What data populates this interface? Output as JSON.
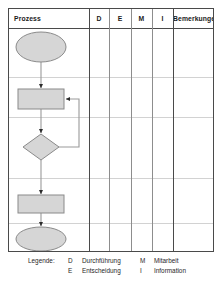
{
  "table": {
    "columns": [
      {
        "key": "prozess",
        "label": "Prozess",
        "x": 0,
        "w": 80,
        "align": "left"
      },
      {
        "key": "d",
        "label": "D",
        "x": 80,
        "w": 20,
        "align": "center"
      },
      {
        "key": "e",
        "label": "E",
        "x": 100,
        "w": 22,
        "align": "center"
      },
      {
        "key": "m",
        "label": "M",
        "x": 122,
        "w": 21,
        "align": "center"
      },
      {
        "key": "i",
        "label": "I",
        "x": 143,
        "w": 21,
        "align": "center"
      },
      {
        "key": "bemerkungen",
        "label": "Bemerkungen",
        "x": 164,
        "w": 40,
        "align": "center"
      }
    ],
    "row_separators_y": [
      68,
      108,
      169,
      214
    ],
    "column_separators_x": [
      80,
      100,
      122,
      143,
      164
    ],
    "border_color": "#4a4a4a",
    "grid_color": "#d2d2d2",
    "column_line_color": "#8d8d8d"
  },
  "flowchart": {
    "shape_fill": "#d6d6d6",
    "shape_stroke": "#8a8a8a",
    "connector_color": "#9a9a9a",
    "arrow_color": "#2b2b2b",
    "nodes": [
      {
        "name": "start-terminator",
        "type": "terminator",
        "cx": 32,
        "cy": 38,
        "rx": 25,
        "ry": 15,
        "label": ""
      },
      {
        "name": "process-step-1",
        "type": "process",
        "x": 9,
        "y": 80,
        "w": 46,
        "h": 20,
        "label": ""
      },
      {
        "name": "decision-step",
        "type": "decision",
        "cx": 32,
        "cy": 138,
        "rx": 18,
        "ry": 13,
        "label": ""
      },
      {
        "name": "process-step-2",
        "type": "process",
        "x": 9,
        "y": 186,
        "w": 46,
        "h": 18,
        "label": ""
      },
      {
        "name": "end-terminator",
        "type": "terminator",
        "cx": 32,
        "cy": 230,
        "rx": 25,
        "ry": 12,
        "label": ""
      }
    ],
    "connectors": [
      {
        "name": "start-to-process1",
        "from": "start-terminator",
        "to": "process-step-1"
      },
      {
        "name": "process1-to-decision",
        "from": "process-step-1",
        "to": "decision-step"
      },
      {
        "name": "decision-to-process2",
        "from": "decision-step",
        "to": "process-step-2"
      },
      {
        "name": "process2-to-end",
        "from": "process-step-2",
        "to": "end-terminator"
      },
      {
        "name": "decision-feedback-loop",
        "from": "decision-step",
        "to": "process-step-1"
      }
    ]
  },
  "legend": {
    "title": "Legende:",
    "entries": [
      {
        "key": "D",
        "text": "Durchführung"
      },
      {
        "key": "E",
        "text": "Entscheidung"
      },
      {
        "key": "M",
        "text": "Mitarbeit"
      },
      {
        "key": "I",
        "text": "Information"
      }
    ]
  }
}
